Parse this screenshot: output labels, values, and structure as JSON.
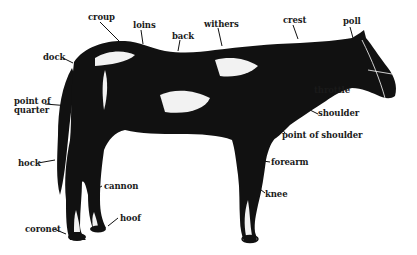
{
  "diagram": {
    "colors": {
      "ink": "#111111",
      "background": "#ffffff",
      "highlight": "#f2f2f2"
    },
    "labels": [
      {
        "id": "croup",
        "text": "croup",
        "x": 88,
        "y": 13
      },
      {
        "id": "loins",
        "text": "loins",
        "x": 133,
        "y": 21
      },
      {
        "id": "withers",
        "text": "withers",
        "x": 204,
        "y": 20
      },
      {
        "id": "back",
        "text": "back",
        "x": 172,
        "y": 32
      },
      {
        "id": "crest",
        "text": "crest",
        "x": 283,
        "y": 16
      },
      {
        "id": "poll",
        "text": "poll",
        "x": 343,
        "y": 17
      },
      {
        "id": "dock",
        "text": "dock",
        "x": 43,
        "y": 53
      },
      {
        "id": "throttle",
        "text": "throttle",
        "x": 314,
        "y": 86
      },
      {
        "id": "point-of-quarter",
        "text": "point of quarter",
        "x": 14,
        "y": 97
      },
      {
        "id": "shoulder",
        "text": "shoulder",
        "x": 318,
        "y": 109
      },
      {
        "id": "point-of-shoulder",
        "text": "point of shoulder",
        "x": 282,
        "y": 131
      },
      {
        "id": "hock",
        "text": "hock",
        "x": 18,
        "y": 159
      },
      {
        "id": "forearm",
        "text": "forearm",
        "x": 271,
        "y": 158
      },
      {
        "id": "cannon",
        "text": "cannon",
        "x": 104,
        "y": 182
      },
      {
        "id": "knee",
        "text": "knee",
        "x": 265,
        "y": 190
      },
      {
        "id": "hoof",
        "text": "hoof",
        "x": 120,
        "y": 214
      },
      {
        "id": "coronet",
        "text": "coronet",
        "x": 25,
        "y": 225
      }
    ]
  }
}
